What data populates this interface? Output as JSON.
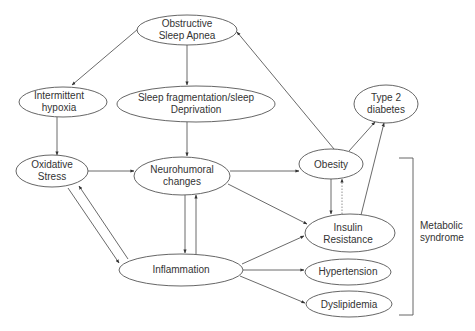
{
  "diagram": {
    "type": "flowchart",
    "nodes": {
      "osa": {
        "line1": "Obstructive",
        "line2": "Sleep Apnea"
      },
      "hypoxia": {
        "line1": "Intermittent",
        "line2": "hypoxia"
      },
      "sleep_frag": {
        "line1": "Sleep fragmentation/sleep",
        "line2": "Deprivation"
      },
      "t2d": {
        "line1": "Type 2",
        "line2": "diabetes"
      },
      "oxidative": {
        "line1": "Oxidative",
        "line2": "Stress"
      },
      "neuro": {
        "line1": "Neurohumoral",
        "line2": "changes"
      },
      "obesity": {
        "line1": "Obesity"
      },
      "insulin": {
        "line1": "Insulin",
        "line2": "Resistance"
      },
      "inflammation": {
        "line1": "Inflammation"
      },
      "hypertension": {
        "line1": "Hypertension"
      },
      "dyslipidemia": {
        "line1": "Dyslipidemia"
      }
    },
    "group": {
      "label_line1": "Metabolic",
      "label_line2": "syndrome",
      "members": [
        "Obesity",
        "Insulin Resistance",
        "Hypertension",
        "Dyslipidemia"
      ]
    },
    "edges": [
      {
        "from": "Obstructive Sleep Apnea",
        "to": "Intermittent hypoxia"
      },
      {
        "from": "Obstructive Sleep Apnea",
        "to": "Sleep fragmentation/sleep Deprivation"
      },
      {
        "from": "Intermittent hypoxia",
        "to": "Oxidative Stress"
      },
      {
        "from": "Sleep fragmentation/sleep Deprivation",
        "to": "Neurohumoral changes"
      },
      {
        "from": "Oxidative Stress",
        "to": "Neurohumoral changes"
      },
      {
        "from": "Oxidative Stress",
        "to": "Inflammation"
      },
      {
        "from": "Inflammation",
        "to": "Oxidative Stress"
      },
      {
        "from": "Neurohumoral changes",
        "to": "Inflammation"
      },
      {
        "from": "Inflammation",
        "to": "Neurohumoral changes"
      },
      {
        "from": "Neurohumoral changes",
        "to": "Obesity"
      },
      {
        "from": "Neurohumoral changes",
        "to": "Insulin Resistance"
      },
      {
        "from": "Obesity",
        "to": "Obstructive Sleep Apnea"
      },
      {
        "from": "Obesity",
        "to": "Type 2 diabetes"
      },
      {
        "from": "Obesity",
        "to": "Insulin Resistance"
      },
      {
        "from": "Insulin Resistance",
        "to": "Obesity",
        "style": "dotted"
      },
      {
        "from": "Insulin Resistance",
        "to": "Type 2 diabetes"
      },
      {
        "from": "Inflammation",
        "to": "Insulin Resistance"
      },
      {
        "from": "Inflammation",
        "to": "Hypertension"
      },
      {
        "from": "Inflammation",
        "to": "Dyslipidemia"
      }
    ]
  }
}
